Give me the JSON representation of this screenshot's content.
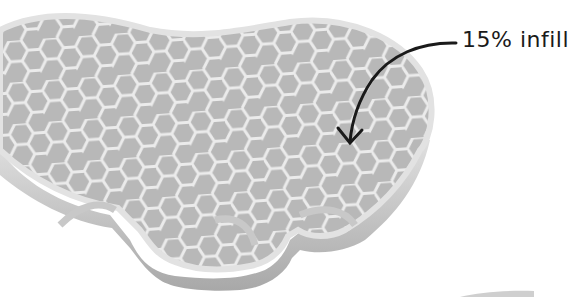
{
  "illustration": {
    "subject": "3D printed part with hexagonal infill",
    "annotation": {
      "text": "15% infill",
      "arrow": "curved-arrow"
    },
    "colors": {
      "background": "#ffffff",
      "part_wall": "#d4d4d4",
      "part_wall_shadow": "#a9a9a9",
      "hex_cell": "#b9b9b9",
      "hex_line": "#ececec",
      "ink": "#1a1a1a"
    }
  }
}
